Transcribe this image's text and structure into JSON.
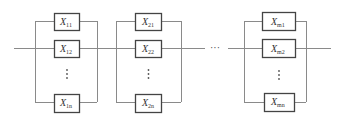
{
  "diagram": {
    "type": "series-parallel reliability block diagram",
    "groups": [
      {
        "id": "group-1",
        "blocks": [
          {
            "var": "X",
            "sub": "11"
          },
          {
            "var": "X",
            "sub": "12"
          },
          {
            "var": "X",
            "sub": "1n"
          }
        ],
        "ellipsis": "⋮"
      },
      {
        "id": "group-2",
        "blocks": [
          {
            "var": "X",
            "sub": "21"
          },
          {
            "var": "X",
            "sub": "22"
          },
          {
            "var": "X",
            "sub": "2n"
          }
        ],
        "ellipsis": "⋮"
      },
      {
        "id": "group-m",
        "blocks": [
          {
            "var": "X",
            "sub": "m1"
          },
          {
            "var": "X",
            "sub": "m2"
          },
          {
            "var": "X",
            "sub": "mn"
          }
        ],
        "ellipsis": "⋮"
      }
    ],
    "series_ellipsis": "···",
    "colors": {
      "wire": "#8a8a8a",
      "box_border": "#444444",
      "text": "#333333"
    }
  }
}
